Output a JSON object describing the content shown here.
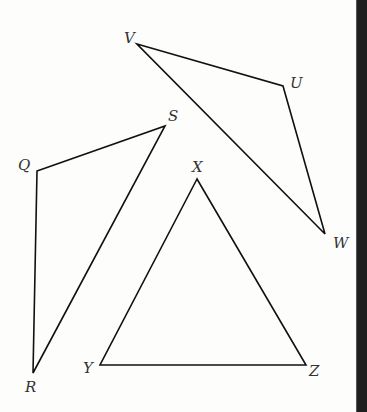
{
  "figure": {
    "stroke_color": "#111111",
    "label_color": "#333333",
    "edge_bar_color": "#1f1f1f",
    "triangles": [
      {
        "name": "VUW",
        "vertices": [
          {
            "label": "V",
            "x": 137,
            "y": 44,
            "lx": 124,
            "ly": 43
          },
          {
            "label": "U",
            "x": 283,
            "y": 86,
            "lx": 290,
            "ly": 88
          },
          {
            "label": "W",
            "x": 325,
            "y": 234,
            "lx": 333,
            "ly": 248
          }
        ]
      },
      {
        "name": "QSR",
        "vertices": [
          {
            "label": "Q",
            "x": 37,
            "y": 171,
            "lx": 18,
            "ly": 170
          },
          {
            "label": "S",
            "x": 165,
            "y": 126,
            "lx": 168,
            "ly": 121
          },
          {
            "label": "R",
            "x": 33,
            "y": 373,
            "lx": 25,
            "ly": 392
          }
        ]
      },
      {
        "name": "XYZ",
        "vertices": [
          {
            "label": "X",
            "x": 197,
            "y": 179,
            "lx": 192,
            "ly": 172
          },
          {
            "label": "Y",
            "x": 100,
            "y": 365,
            "lx": 83,
            "ly": 373
          },
          {
            "label": "Z",
            "x": 306,
            "y": 365,
            "lx": 309,
            "ly": 376
          }
        ]
      }
    ]
  }
}
